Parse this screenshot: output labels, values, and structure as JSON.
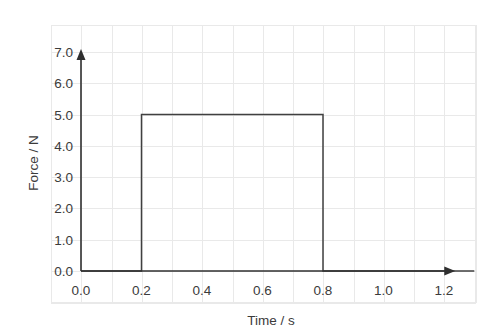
{
  "chart_data": {
    "type": "line",
    "title": "",
    "subtitle": "",
    "xlabel": "Time / s",
    "ylabel": "Force / N",
    "xlim": [
      0.0,
      1.3
    ],
    "ylim": [
      0.0,
      7.0
    ],
    "xticks": [
      "0.0",
      "0.2",
      "0.4",
      "0.6",
      "0.8",
      "1.0",
      "1.2"
    ],
    "xtick_values": [
      0.0,
      0.2,
      0.4,
      0.6,
      0.8,
      1.0,
      1.2
    ],
    "yticks": [
      "0.0",
      "1.0",
      "2.0",
      "3.0",
      "4.0",
      "5.0",
      "6.0",
      "7.0"
    ],
    "ytick_values": [
      0.0,
      1.0,
      2.0,
      3.0,
      4.0,
      5.0,
      6.0,
      7.0
    ],
    "grid": true,
    "grid_minor_step_x": 0.1,
    "grid_minor_step_y": 1.0,
    "legend": null,
    "legend_position": "none",
    "annotations": [],
    "series": [
      {
        "name": "Force pulse",
        "color": "#404040",
        "x": [
          0.0,
          0.2,
          0.2,
          0.8,
          0.8,
          1.3
        ],
        "y": [
          0.0,
          0.0,
          5.0,
          5.0,
          0.0,
          0.0
        ],
        "pulse": {
          "start_time": 0.2,
          "end_time": 0.8,
          "magnitude": 5.0,
          "duration": 0.6,
          "impulse": 3.0
        }
      }
    ],
    "axis_arrows": {
      "x_axis": "arrow-right",
      "y_axis": "arrow-up"
    }
  },
  "colors": {
    "background": "#ffffff",
    "grid": "#e9e9e9",
    "axis": "#2f2f2f",
    "series": "#404040",
    "text": "#3b3b3b"
  },
  "icons": {
    "x_axis_arrow": "arrow-right-icon",
    "y_axis_arrow": "arrow-up-icon"
  }
}
